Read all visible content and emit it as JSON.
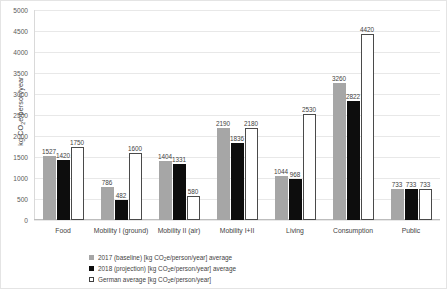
{
  "chart_data": {
    "type": "bar",
    "title": "",
    "xlabel": "",
    "ylabel": "kg CO2e/person/year",
    "ylim": [
      0,
      5000
    ],
    "ytick_step": 500,
    "grid": true,
    "legend_position": "bottom",
    "categories": [
      "Food",
      "Mobility I (ground)",
      "Mobility II (air)",
      "Mobility I+II",
      "Living",
      "Consumption",
      "Public"
    ],
    "series": [
      {
        "name": "2017 (baseline) [kg CO2e/person/year] average",
        "color": "#a6a6a6",
        "values": [
          1527,
          786,
          1404,
          2190,
          1044,
          3260,
          733
        ]
      },
      {
        "name": "2018 (projection) [kg CO2e/person/year] average",
        "color": "#0d0d0d",
        "values": [
          1420,
          482,
          1331,
          1836,
          968,
          2822,
          733
        ]
      },
      {
        "name": "German average [kg CO2e/person/year]",
        "color": "#ffffff",
        "values": [
          1750,
          1600,
          580,
          2180,
          2530,
          4420,
          733
        ]
      }
    ],
    "ytick_labels": [
      "5000",
      "4500",
      "4000",
      "3500",
      "3000",
      "2500",
      "2000",
      "1500",
      "1000",
      "500",
      "0"
    ]
  },
  "axis": {
    "y_title_prefix": "kg CO",
    "y_title_sub": "2",
    "y_title_suffix": "e/person/year"
  },
  "legend": {
    "items": [
      {
        "marker": "gray-square-icon",
        "prefix": "2017 (baseline) [kg CO",
        "sub": "2",
        "suffix": "e/person/year] average"
      },
      {
        "marker": "black-square-icon",
        "prefix": "2018 (projection) [kg CO",
        "sub": "2",
        "suffix": "e/person/year] average"
      },
      {
        "marker": "white-square-icon",
        "prefix": "German average [kg CO",
        "sub": "2",
        "suffix": "e/person/year]"
      }
    ]
  }
}
